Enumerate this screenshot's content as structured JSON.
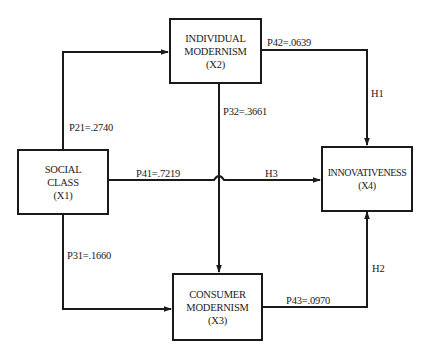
{
  "nodes": {
    "x1": {
      "line1": "SOCIAL",
      "line2": "CLASS",
      "line3": "(X1)"
    },
    "x2": {
      "line1": "INDIVIDUAL",
      "line2": "MODERNISM",
      "line3": "(X2)"
    },
    "x3": {
      "line1": "CONSUMER",
      "line2": "MODERNISM",
      "line3": "(X3)"
    },
    "x4": {
      "line1": "INNOVATIVENESS",
      "line2": "(X4)"
    }
  },
  "paths": {
    "p21": "P21=.2740",
    "p31": "P31=.1660",
    "p41": "P41=.7219",
    "p32": "P32=.3661",
    "p42": "P42=.0639",
    "p43": "P43=.0970"
  },
  "hypotheses": {
    "h1": "H1",
    "h2": "H2",
    "h3": "H3"
  },
  "colors": {
    "line": "#1a1a1a",
    "background": "#ffffff"
  }
}
